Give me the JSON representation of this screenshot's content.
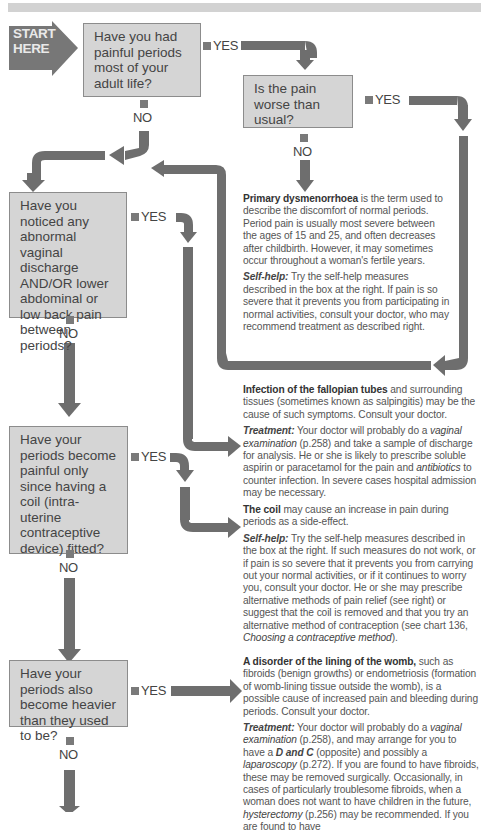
{
  "start": {
    "label_line1": "START",
    "label_line2": "HERE"
  },
  "colors": {
    "box_fill": "#d5d5d5",
    "box_border": "#8c8c8c",
    "arrow": "#6e6e6e",
    "band": "#d2d2d2",
    "start_arrow": "#777777"
  },
  "questions": [
    {
      "id": "q1",
      "text": "Have you had painful periods most of your adult life?",
      "yes": "YES",
      "no": "NO"
    },
    {
      "id": "q1a",
      "text": "Is the pain worse than usual?",
      "yes": "YES",
      "no": "NO"
    },
    {
      "id": "q2",
      "text": "Have you noticed any abnormal vaginal discharge AND/OR lower abdominal or low back pain between periods?",
      "yes": "YES",
      "no": "NO"
    },
    {
      "id": "q3",
      "text": "Have your periods become painful only since having a coil (intra-uterine contraceptive device) fitted?",
      "yes": "YES",
      "no": "NO"
    },
    {
      "id": "q4",
      "text": "Have your periods also become heavier than they used to be?",
      "yes": "YES",
      "no": "NO"
    }
  ],
  "outcomes": {
    "dysmenorrhoea": {
      "title": "Primary dysmenorrhoea",
      "body": " is the term used to describe the discomfort of normal periods. Period pain is usually most severe between the ages of 15 and 25, and often decreases after childbirth. However, it may sometimes occur throughout a woman's fertile years.",
      "selfhelp_label": "Self-help:",
      "selfhelp": " Try the self-help measures described in the box at the right. If pain is so severe that it prevents you from participating in normal activities, consult your doctor, who may recommend treatment as described right."
    },
    "infection": {
      "title": "Infection of the fallopian tubes",
      "body": " and surrounding tissues (sometimes known as salpingitis) may be the cause of such symptoms. Consult your doctor.",
      "treatment_label": "Treatment:",
      "t1": " Your doctor will probably do a ",
      "t_exam": "vaginal examination",
      "t2": " (p.258) and take a sample of discharge for analysis. He or she is likely to prescribe soluble aspirin or paracetamol for the pain and ",
      "t_antibiotics": "antibiotics",
      "t3": " to counter infection. In severe cases hospital admission may be necessary."
    },
    "coil": {
      "title": "The coil",
      "body": " may cause an increase in pain during periods as a side-effect.",
      "selfhelp_label": "Self-help:",
      "s1": " Try the self-help measures described in the box at the right. If such measures do not work, or if pain is so severe that it prevents you from carrying out your normal activities, or if it continues to worry you, consult your doctor. He or she may prescribe alternative methods of pain relief (see right) or suggest that the coil is removed and that you try an alternative method of contraception (see chart 136, ",
      "s_chart": "Choosing a contraceptive method",
      "s2": ")."
    },
    "womb": {
      "title": "A disorder of the lining of the womb,",
      "body": " such as fibroids (benign growths) or endometriosis (formation of womb-lining tissue outside the womb), is a possible cause of increased pain and bleeding during periods. Consult your doctor.",
      "treatment_label": "Treatment:",
      "t1": " Your doctor will probably do a ",
      "t_exam": "vaginal examination",
      "t2": " (p.258), and may arrange for you to have a ",
      "t_dc": "D and C",
      "t3": " (opposite) and possibly a ",
      "t_lap": "laparoscopy",
      "t4": " (p.272). If you are found to have fibroids, these may be removed surgically. Occasionally, in cases of particularly troublesome fibroids, when a woman does not want to have children in the future, ",
      "t_hyst": "hysterectomy",
      "t5": " (p.256) may be recommended. If you are found to have"
    }
  }
}
